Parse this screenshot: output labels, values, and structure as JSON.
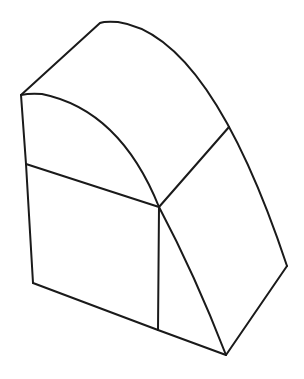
{
  "figure": {
    "description": "Isometric line drawing of a solid block with a curved (quarter-cylindrical) top surface",
    "stroke_color": "#1a1a1a",
    "background_color": "#ffffff"
  },
  "geometry": {
    "outer_top_edge": "M21 95 L100 23 Q105 21 118 22 Q210 35 287 266",
    "inner_arc_edge": "M21 95 Q30 93 42 94 Q120 110 159 207 Q195 275 226 355",
    "diagonal_edge": "M229 127 L159 207",
    "left_edge": "M21 95 L26 164 L33 283",
    "middle_edge": "M26 164 L159 207",
    "vertical_edge": "M159 207 L158 330",
    "bottom_edge": "M33 283 L158 330 L226 355",
    "right_bottom_edge": "M226 355 L287 266"
  }
}
